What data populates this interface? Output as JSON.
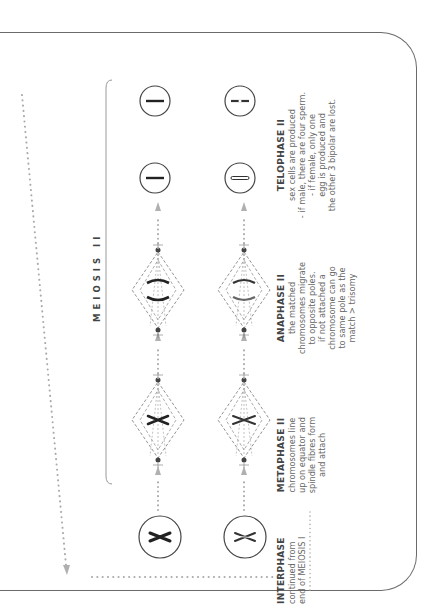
{
  "diagram": {
    "title": "MEIOSIS II",
    "phases": [
      {
        "heading": "TELOPHASE II",
        "lines": [
          "sex cells are produced",
          "- if male, there are four sperm.",
          "- if female, only one",
          "egg is produced and",
          "the other 3 bipolar are lost."
        ]
      },
      {
        "heading": "ANAPHASE II",
        "lines": [
          "the matched",
          "chromosomes migrate",
          "to opposite poles.",
          "if not attached a",
          "chromosome can go",
          "to same pole as the",
          "match > trisomy"
        ]
      },
      {
        "heading": "METAPHASE II",
        "lines": [
          "chromosomes line",
          "up on equator and",
          "spindle fibres form",
          "and attach"
        ]
      },
      {
        "heading": "INTERPHASE",
        "lines": [
          "continued from",
          "end of MEIOSIS I"
        ]
      }
    ],
    "colors": {
      "line": "#6a6a6a",
      "dots": "#aaaaaa",
      "text": "#555555",
      "arrow": "#b0b0b0"
    }
  }
}
